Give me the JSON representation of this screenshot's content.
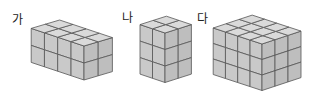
{
  "figures": [
    {
      "label": "가",
      "label_pos": [
        12,
        14
      ],
      "cubes": {
        "width": 4,
        "depth": 2,
        "height": 2
      },
      "origin": [
        84,
        46
      ],
      "u": [
        -13.2,
        -4.4
      ],
      "v": [
        14.2,
        -4.2
      ],
      "h": 17
    },
    {
      "label": "나",
      "label_pos": [
        122,
        12
      ],
      "cubes": {
        "width": 2,
        "depth": 2,
        "height": 3
      },
      "origin": [
        165,
        33
      ],
      "u": [
        -12.5,
        -4.2
      ],
      "v": [
        13.2,
        -4.2
      ],
      "h": 16.5
    },
    {
      "label": "다",
      "label_pos": [
        197,
        13
      ],
      "cubes": {
        "width": 4,
        "depth": 3,
        "height": 3
      },
      "origin": [
        262,
        44
      ],
      "u": [
        -12.2,
        -4.0
      ],
      "v": [
        13.0,
        -4.3
      ],
      "h": 15.5
    }
  ],
  "colors": {
    "top": "#dadada",
    "left": "#c9c9c9",
    "right": "#bebebe",
    "stroke": "#555555"
  }
}
